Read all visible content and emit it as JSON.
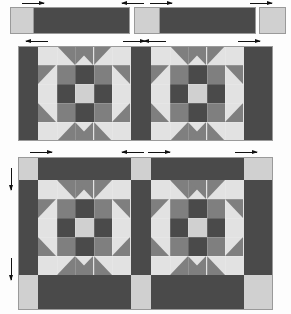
{
  "diagram": {
    "type": "quilt-piecing-diagram"
  },
  "colors": {
    "background": "#fdfdfd",
    "dark": "#4a4a4a",
    "dark_navy": "#494b50",
    "medium": "#7f7f7f",
    "medium_gray": "#808183",
    "light": "#d0d0d0",
    "light_gray": "#cfd0d0",
    "pale": "#e2e2e2",
    "seam_line": "#f2f2f2",
    "outline": "#9a9a9a",
    "arrow": "#111111"
  },
  "stage_top": {
    "name": "strip-row",
    "label": "cut strips and cornerstones",
    "pieces": [
      {
        "name": "cornerstone-left",
        "tone": "light",
        "x": 10,
        "y": 7,
        "w": 27,
        "h": 27
      },
      {
        "name": "sashing-strip-1",
        "tone": "dark",
        "x": 33,
        "y": 7,
        "w": 97,
        "h": 27
      },
      {
        "name": "cornerstone-mid",
        "tone": "light",
        "x": 134,
        "y": 7,
        "w": 27,
        "h": 27
      },
      {
        "name": "sashing-strip-2",
        "tone": "dark",
        "x": 159,
        "y": 7,
        "w": 97,
        "h": 27
      },
      {
        "name": "cornerstone-right",
        "tone": "light",
        "x": 259,
        "y": 7,
        "w": 27,
        "h": 27
      }
    ],
    "arrows": [
      {
        "name": "seam-arrow-1",
        "dir": "right",
        "x": 22,
        "y": 1
      },
      {
        "name": "seam-arrow-2",
        "dir": "left",
        "x": 122,
        "y": 1
      },
      {
        "name": "seam-arrow-3",
        "dir": "right",
        "x": 150,
        "y": 1
      },
      {
        "name": "seam-arrow-4",
        "dir": "right",
        "x": 250,
        "y": 1
      }
    ]
  },
  "stage_middle": {
    "name": "block-row-with-vertical-sashing",
    "label": "blocks joined with vertical sashing",
    "frame": {
      "x": 18,
      "y": 46,
      "w": 255,
      "h": 95
    },
    "sashing": [
      {
        "name": "sashing-left",
        "x": 18,
        "y": 46,
        "w": 20,
        "h": 95
      },
      {
        "name": "sashing-center",
        "x": 131,
        "y": 46,
        "w": 20,
        "h": 95
      },
      {
        "name": "sashing-right",
        "x": 244,
        "y": 46,
        "w": 29,
        "h": 95
      }
    ],
    "blocks": [
      {
        "name": "block-1",
        "x": 38,
        "y": 46,
        "w": 93,
        "h": 95
      },
      {
        "name": "block-2",
        "x": 151,
        "y": 46,
        "w": 93,
        "h": 95
      }
    ],
    "arrows": [
      {
        "name": "seam-arrow-5",
        "dir": "left",
        "x": 26,
        "y": 39
      },
      {
        "name": "seam-arrow-6",
        "dir": "right",
        "x": 123,
        "y": 39
      },
      {
        "name": "seam-arrow-7",
        "dir": "left",
        "x": 144,
        "y": 39
      },
      {
        "name": "seam-arrow-8",
        "dir": "right",
        "x": 238,
        "y": 39
      }
    ]
  },
  "stage_bottom": {
    "name": "block-row-framed",
    "label": "row framed with horizontal sashing and cornerstones",
    "frame": {
      "x": 18,
      "y": 157,
      "w": 255,
      "h": 153
    },
    "top_sashing": [
      {
        "name": "corner-top-left",
        "tone": "light",
        "x": 18,
        "y": 157,
        "w": 20,
        "h": 23
      },
      {
        "name": "sash-top-1",
        "tone": "dark",
        "x": 38,
        "y": 157,
        "w": 93,
        "h": 23
      },
      {
        "name": "corner-top-mid",
        "tone": "light",
        "x": 131,
        "y": 157,
        "w": 20,
        "h": 23
      },
      {
        "name": "sash-top-2",
        "tone": "dark",
        "x": 151,
        "y": 157,
        "w": 93,
        "h": 23
      },
      {
        "name": "corner-top-right",
        "tone": "light",
        "x": 244,
        "y": 157,
        "w": 29,
        "h": 23
      }
    ],
    "middle_sashing": [
      {
        "name": "sash-left",
        "x": 18,
        "y": 180,
        "w": 20,
        "h": 95
      },
      {
        "name": "sash-center",
        "x": 131,
        "y": 180,
        "w": 20,
        "h": 95
      },
      {
        "name": "sash-right",
        "x": 244,
        "y": 180,
        "w": 29,
        "h": 95
      }
    ],
    "blocks": [
      {
        "name": "block-3",
        "x": 38,
        "y": 180,
        "w": 93,
        "h": 95
      },
      {
        "name": "block-4",
        "x": 151,
        "y": 180,
        "w": 93,
        "h": 95
      }
    ],
    "bottom_sashing": [
      {
        "name": "corner-bottom-left",
        "tone": "light",
        "x": 18,
        "y": 275,
        "w": 20,
        "h": 35
      },
      {
        "name": "sash-bottom-1",
        "tone": "dark",
        "x": 38,
        "y": 275,
        "w": 93,
        "h": 35
      },
      {
        "name": "corner-bottom-mid",
        "tone": "light",
        "x": 131,
        "y": 275,
        "w": 20,
        "h": 35
      },
      {
        "name": "sash-bottom-2",
        "tone": "dark",
        "x": 151,
        "y": 275,
        "w": 93,
        "h": 35
      },
      {
        "name": "corner-bottom-right",
        "tone": "light",
        "x": 244,
        "y": 275,
        "w": 29,
        "h": 35
      }
    ],
    "arrows_h": [
      {
        "name": "seam-arrow-9",
        "dir": "right",
        "x": 30,
        "y": 150
      },
      {
        "name": "seam-arrow-10",
        "dir": "left",
        "x": 122,
        "y": 150
      },
      {
        "name": "seam-arrow-11",
        "dir": "right",
        "x": 148,
        "y": 150
      },
      {
        "name": "seam-arrow-12",
        "dir": "right",
        "x": 235,
        "y": 150
      }
    ],
    "arrows_v": [
      {
        "name": "seam-arrow-13",
        "dir": "down",
        "x": 9,
        "y": 168
      },
      {
        "name": "seam-arrow-14",
        "dir": "down",
        "x": 9,
        "y": 258
      }
    ]
  },
  "block_pattern": {
    "name": "churn-dash-star-block",
    "grid": 5,
    "legend": [
      {
        "name": "center-square",
        "tone": "light"
      },
      {
        "name": "cross-bar",
        "tone": "dark"
      },
      {
        "name": "corner-square",
        "tone": "medium"
      },
      {
        "name": "background-triangle",
        "tone": "pale"
      },
      {
        "name": "point-triangle",
        "tone": "medium"
      }
    ]
  }
}
